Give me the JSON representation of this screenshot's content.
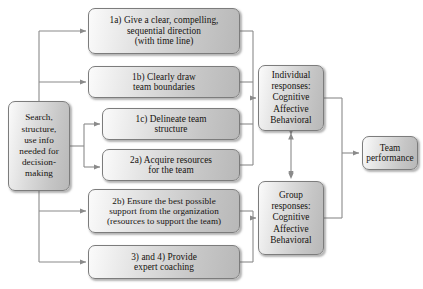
{
  "diagram": {
    "colors": {
      "box_border": "#7c7c7c",
      "box_fill_light": "#fbfbfb",
      "box_fill_dark": "#b8b8b8",
      "line": "#8a8a8a",
      "text": "#15120f"
    },
    "nodes": {
      "search": "Search, structure, use info needed for decision-making",
      "step_1a": "1a) Give a clear, compelling, sequential direction (with time line)",
      "step_1b": "1b) Clearly draw team boundaries",
      "step_1c": "1c) Delineate team structure",
      "step_2a": "2a) Acquire resources for the team",
      "step_2b": "2b) Ensure the best possible support from the organization (resources to support the team)",
      "step_34": "3) and 4) Provide expert coaching",
      "individual": "Individual responses: Cognitive Affective Behavioral",
      "group": "Group responses: Cognitive Affective Behavioral",
      "team": "Team performance"
    },
    "node_lines": {
      "search": [
        "Search,",
        "structure,",
        "use info",
        "needed  for",
        "decision-",
        "making"
      ],
      "step_1a": [
        "1a) Give a clear, compelling,",
        "sequential direction",
        "(with time line)"
      ],
      "step_1b": [
        "1b) Clearly draw",
        "team boundaries"
      ],
      "step_1c": [
        "1c) Delineate team",
        "structure"
      ],
      "step_2a": [
        "2a) Acquire resources",
        "for the team"
      ],
      "step_2b": [
        "2b) Ensure the best possible",
        "support from the organization",
        "(resources to support the team)"
      ],
      "step_34": [
        "3) and 4) Provide",
        "expert coaching"
      ],
      "individual": [
        "Individual",
        "responses:",
        "Cognitive",
        "Affective",
        "Behavioral"
      ],
      "group": [
        "Group",
        "responses:",
        "Cognitive",
        "Affective",
        "Behavioral"
      ],
      "team": [
        "Team",
        "performance"
      ]
    }
  }
}
